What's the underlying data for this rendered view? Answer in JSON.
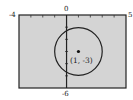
{
  "chart_data": {
    "type": "line",
    "title": "",
    "xlabel": "",
    "ylabel": "",
    "xlim": [
      -4,
      5
    ],
    "ylim": [
      -6,
      0
    ],
    "grid": false,
    "series": [
      {
        "name": "circle",
        "shape": "circle",
        "center": [
          1,
          -3
        ],
        "radius": 2
      }
    ],
    "points": [
      {
        "x": 1,
        "y": -3,
        "label": "(1, -3)"
      }
    ],
    "window_labels": {
      "xmin": "-4",
      "xmax": "5",
      "ymin": "-6",
      "axis_zero": "0"
    }
  },
  "colors": {
    "plot_bg": "#d4d4d4",
    "frame": "#222222",
    "curve": "#222222"
  }
}
